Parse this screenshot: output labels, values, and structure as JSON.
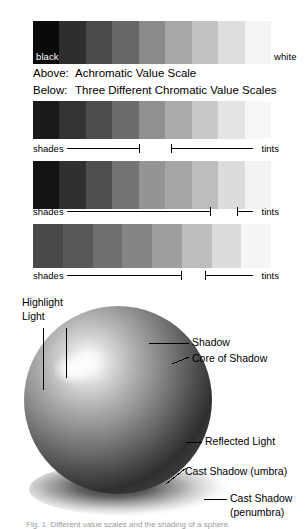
{
  "figure": {
    "bottom_caption": "Fig. 1. Different value scales and the shading of a sphere."
  },
  "value_scales": {
    "endpoint_labels": {
      "dark": "black",
      "light": "white"
    },
    "caption_lines": [
      {
        "key": "Above:",
        "text": "Achromatic Value Scale"
      },
      {
        "key": "Below:",
        "text": "Three Different Chromatic Value Scales"
      }
    ],
    "annotation_labels": {
      "shades": "shades",
      "tints": "tints"
    },
    "bars": [
      {
        "name": "achromatic-value-scale",
        "steps": 9,
        "swatches": [
          "#0a0a0a",
          "#2e2e2e",
          "#4a4a4a",
          "#666666",
          "#8a8a8a",
          "#a8a8a8",
          "#c2c2c2",
          "#dedede",
          "#f4f4f4"
        ]
      },
      {
        "name": "chromatic-value-scale-1",
        "steps": 9,
        "swatches": [
          "#1a1a1a",
          "#333333",
          "#4d4d4d",
          "#6b6b6b",
          "#909090",
          "#ababab",
          "#c9c9c9",
          "#e4e4e4",
          "#f7f7f7"
        ]
      },
      {
        "name": "chromatic-value-scale-2",
        "steps": 9,
        "swatches": [
          "#141414",
          "#303030",
          "#4f4f4f",
          "#737373",
          "#949494",
          "#a6a6a6",
          "#bdbdbd",
          "#dcdcdc",
          "#f3f3f3"
        ]
      },
      {
        "name": "chromatic-value-scale-3",
        "steps": 8,
        "swatches": [
          "#494949",
          "#585858",
          "#6f6f6f",
          "#858585",
          "#9e9e9e",
          "#bdbdbd",
          "#dcdcdc",
          "#f5f5f5"
        ]
      }
    ],
    "annotation_rows": [
      {
        "name": "shades-tints-row-1",
        "shade_end_pct": 43,
        "tint_start_pct": 56
      },
      {
        "name": "shades-tints-row-2",
        "shade_end_pct": 72,
        "tint_start_pct": 83
      },
      {
        "name": "shades-tints-row-3",
        "shade_end_pct": 60,
        "tint_start_pct": 70
      }
    ]
  },
  "sphere_diagram": {
    "name": "shaded-sphere",
    "labels": {
      "highlight": "Highlight",
      "light": "Light",
      "shadow": "Shadow",
      "core_of_shadow": "Core of Shadow",
      "reflected_light": "Reflected Light",
      "cast_shadow_umbra": "Cast Shadow (umbra)",
      "cast_shadow_penumbra_line1": "Cast Shadow",
      "cast_shadow_penumbra_line2": "(penumbra)"
    }
  }
}
